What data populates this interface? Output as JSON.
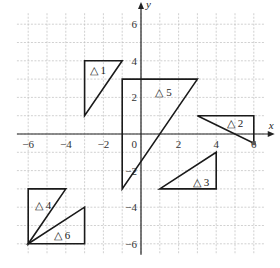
{
  "diagram": {
    "axes": {
      "x_label": "x",
      "y_label": "y",
      "range": [
        -6,
        6
      ]
    },
    "x_ticks": [
      {
        "v": -6,
        "label": "−6"
      },
      {
        "v": -4,
        "label": "−4"
      },
      {
        "v": -2,
        "label": "−2"
      },
      {
        "v": 2,
        "label": "2"
      },
      {
        "v": 4,
        "label": "4"
      },
      {
        "v": 6,
        "label": "6"
      }
    ],
    "y_ticks": [
      {
        "v": 6,
        "label": "6"
      },
      {
        "v": 4,
        "label": "4"
      },
      {
        "v": 2,
        "label": "2"
      },
      {
        "v": -2,
        "label": "−2"
      },
      {
        "v": -4,
        "label": "−4"
      },
      {
        "v": -6,
        "label": "−6"
      }
    ],
    "origin_label": "0",
    "triangles": [
      {
        "label": "△ 1",
        "points": [
          [
            -3,
            4
          ],
          [
            -1,
            4
          ],
          [
            -3,
            1
          ]
        ],
        "label_at": [
          -2.3,
          3.5
        ]
      },
      {
        "label": "△ 2",
        "points": [
          [
            3,
            1
          ],
          [
            6,
            1
          ],
          [
            6,
            -0.5
          ]
        ],
        "label_at": [
          5,
          0.6
        ]
      },
      {
        "label": "△ 3",
        "points": [
          [
            1,
            -3
          ],
          [
            4,
            -3
          ],
          [
            4,
            -1
          ]
        ],
        "label_at": [
          3.2,
          -2.6
        ]
      },
      {
        "label": "△ 4",
        "points": [
          [
            -6,
            -3
          ],
          [
            -4,
            -3
          ],
          [
            -6,
            -6
          ]
        ],
        "label_at": [
          -5.2,
          -3.9
        ]
      },
      {
        "label": "△ 5",
        "points": [
          [
            -1,
            3
          ],
          [
            3,
            3
          ],
          [
            -1,
            -3
          ]
        ],
        "label_at": [
          1.2,
          2.3
        ]
      },
      {
        "label": "△ 6",
        "points": [
          [
            -6,
            -6
          ],
          [
            -3,
            -6
          ],
          [
            -3,
            -4
          ]
        ],
        "label_at": [
          -4.2,
          -5.5
        ]
      }
    ],
    "marked_point": [
      6,
      -0.5
    ]
  }
}
